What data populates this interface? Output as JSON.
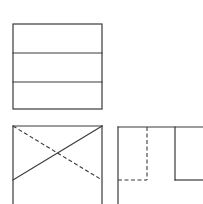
{
  "diagram": {
    "stroke_color": "#3a3a3a",
    "background": "#ffffff",
    "views": [
      {
        "name": "top-view",
        "shape": "rectangle divided into three horizontal bands"
      },
      {
        "name": "front-view",
        "shape": "rectangle with crossing diagonals, one solid and one hidden (dashed)"
      },
      {
        "name": "side-view",
        "shape": "outline with a hidden (dashed) notch and a solid step"
      }
    ]
  }
}
